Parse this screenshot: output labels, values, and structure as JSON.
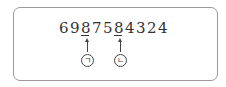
{
  "number": {
    "digits": [
      "6",
      "9",
      "8",
      "7",
      "5",
      "8",
      "4",
      "3",
      "2",
      "4"
    ],
    "marked_positions": [
      2,
      5
    ]
  },
  "markers": [
    {
      "label": "ㄱ",
      "points_to_digit_index": 2
    },
    {
      "label": "ㄴ",
      "points_to_digit_index": 5
    }
  ]
}
